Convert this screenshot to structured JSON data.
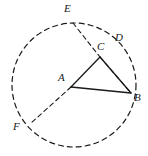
{
  "figure": {
    "width": 148,
    "height": 156,
    "background_color": "#ffffff",
    "stroke_color": "#1a1a1a"
  },
  "circle": {
    "name": "dashed-circle",
    "center": {
      "x": 74,
      "y": 85
    },
    "radius": 62,
    "style": "dashed",
    "dash_pattern": "5 4",
    "stroke_width": 1.2
  },
  "points": [
    {
      "id": "A",
      "label": "A",
      "x": 71,
      "y": 87,
      "label_x": 58,
      "label_y": 72,
      "role": "center-vertex"
    },
    {
      "id": "B",
      "label": "B",
      "x": 131,
      "y": 93,
      "label_x": 134,
      "label_y": 92,
      "role": "circle-point"
    },
    {
      "id": "C",
      "label": "C",
      "x": 100,
      "y": 57,
      "label_x": 97,
      "label_y": 41,
      "role": "chord-intersection"
    },
    {
      "id": "D",
      "label": "D",
      "x": 123,
      "y": 47,
      "label_x": 115,
      "label_y": 32,
      "role": "circle-point"
    },
    {
      "id": "E",
      "label": "E",
      "x": 73,
      "y": 23,
      "label_x": 64,
      "label_y": 3,
      "role": "circle-point"
    },
    {
      "id": "F",
      "label": "F",
      "x": 30,
      "y": 124,
      "label_x": 13,
      "label_y": 121,
      "role": "circle-point"
    }
  ],
  "segments": [
    {
      "name": "segment-AC",
      "from": "A",
      "to": "C",
      "style": "solid",
      "x1": 71,
      "y1": 87,
      "x2": 100,
      "y2": 57
    },
    {
      "name": "segment-CB",
      "from": "C",
      "to": "B",
      "style": "solid",
      "x1": 100,
      "y1": 57,
      "x2": 131,
      "y2": 93
    },
    {
      "name": "segment-AB",
      "from": "A",
      "to": "B",
      "style": "solid",
      "x1": 71,
      "y1": 87,
      "x2": 131,
      "y2": 93
    },
    {
      "name": "segment-EC-dashed",
      "from": "E",
      "to": "C",
      "style": "dashed",
      "x1": 73,
      "y1": 23,
      "x2": 100,
      "y2": 57
    },
    {
      "name": "segment-CB-dashed",
      "from": "C",
      "to": "B",
      "style": "dashed",
      "x1": 100,
      "y1": 57,
      "x2": 131,
      "y2": 93
    },
    {
      "name": "segment-AF-dashed",
      "from": "A",
      "to": "F",
      "style": "dashed",
      "x1": 71,
      "y1": 87,
      "x2": 30,
      "y2": 124
    }
  ]
}
